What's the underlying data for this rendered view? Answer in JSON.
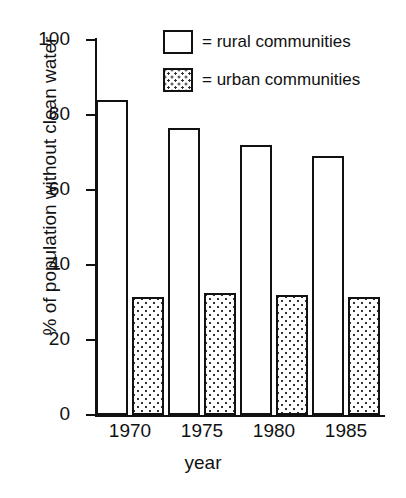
{
  "chart_data": {
    "type": "bar",
    "title": "",
    "xlabel": "year",
    "ylabel": "% of population without clean water",
    "categories": [
      "1970",
      "1975",
      "1980",
      "1985"
    ],
    "series": [
      {
        "name": "rural communities",
        "values": [
          84,
          76.5,
          72,
          69
        ]
      },
      {
        "name": "urban communities",
        "values": [
          31.5,
          32.5,
          32,
          31.5
        ]
      }
    ],
    "ylim": [
      0,
      100
    ],
    "yticks": [
      0,
      20,
      40,
      60,
      80,
      100
    ],
    "ytick_labels": [
      "0",
      "20",
      "40",
      "60",
      "80",
      "100"
    ],
    "grid": false,
    "legend_position": "top-right",
    "legend": [
      {
        "marker": "empty-box",
        "text": "= rural communities"
      },
      {
        "marker": "dotted-box",
        "text": "= urban communities"
      }
    ],
    "colors": {
      "axis": "#111111",
      "rural_fill": "#ffffff",
      "urban_fill": "#ffffff",
      "urban_pattern": "#333333",
      "outline": "#111111"
    }
  }
}
